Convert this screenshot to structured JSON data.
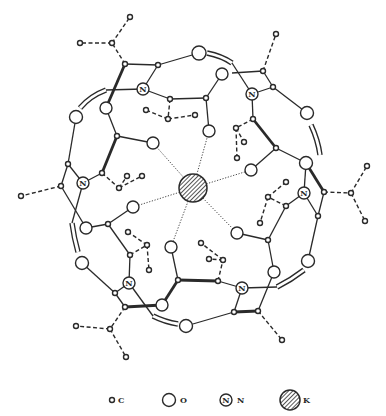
{
  "diagram": {
    "center_atom": {
      "element": "K",
      "x": 193,
      "y": 188,
      "r": 14
    }
  },
  "legend": {
    "items": [
      {
        "symbol": "small-circle",
        "label": "C",
        "icon": "carbon-atom-icon"
      },
      {
        "symbol": "large-circle",
        "label": "O",
        "icon": "oxygen-atom-icon"
      },
      {
        "symbol": "circle-with-N",
        "label": "N",
        "icon": "nitrogen-atom-icon",
        "glyph": "N"
      },
      {
        "symbol": "hatched-circle",
        "label": "K",
        "icon": "potassium-atom-icon"
      }
    ]
  },
  "atoms": {
    "N": [
      {
        "x": 143,
        "y": 89
      },
      {
        "x": 252,
        "y": 94
      },
      {
        "x": 83,
        "y": 183
      },
      {
        "x": 304,
        "y": 193
      },
      {
        "x": 129,
        "y": 283
      },
      {
        "x": 242,
        "y": 288
      }
    ],
    "N_glyph": "N"
  },
  "colors": {
    "ink": "#2a2a2a",
    "background": "#ffffff"
  }
}
